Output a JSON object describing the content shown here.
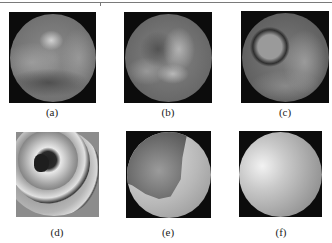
{
  "figure": {
    "panels": [
      {
        "id": "a",
        "label": "(a)",
        "description": "grayscale circular speckle image, faint arc pattern"
      },
      {
        "id": "b",
        "label": "(b)",
        "description": "grayscale circular speckle image, faint arc pattern"
      },
      {
        "id": "c",
        "label": "(c)",
        "description": "grayscale circular image with dark ring fringe"
      },
      {
        "id": "d",
        "label": "(d)",
        "description": "wrapped phase map with concentric fringes and dark center"
      },
      {
        "id": "e",
        "label": "(e)",
        "description": "partially unwrapped phase map with crescent discontinuity"
      },
      {
        "id": "f",
        "label": "(f)",
        "description": "smooth unwrapped phase map, bright highlight upper-left"
      }
    ]
  }
}
